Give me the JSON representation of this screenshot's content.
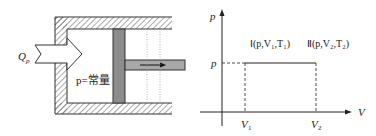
{
  "left_diagram": {
    "inlet_label": "Q",
    "inlet_sub": "p",
    "pressure_label": "p=常量",
    "colors": {
      "piston": "#8c8c8c",
      "rod": "#a8a8a8",
      "hatch": "#555555"
    }
  },
  "right_graph": {
    "y_axis_label": "p",
    "x_axis_label": "V",
    "p_level_label": "p",
    "v1_label": "V",
    "v1_sub": "1",
    "v2_label": "V",
    "v2_sub": "2",
    "state1_label": "Ⅰ(p,V₁,T₁)",
    "state2_label": "Ⅱ(p,V₂,T₂)"
  }
}
